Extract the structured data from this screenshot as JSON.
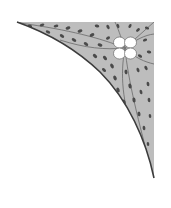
{
  "image": {
    "description": "Decorative ornamental corner spandrel with leaf pattern and four-petal flower",
    "colors": {
      "background": "#ffffff",
      "fill": "#b9b9b9",
      "leaf": "#4a4a4a",
      "vein": "#6a6a6a",
      "edge": "#3c3c3c",
      "flower": "#ffffff"
    }
  },
  "ornament": {
    "icon": "floral-corner-ornament",
    "flower_icon": "four-petal-flower"
  }
}
